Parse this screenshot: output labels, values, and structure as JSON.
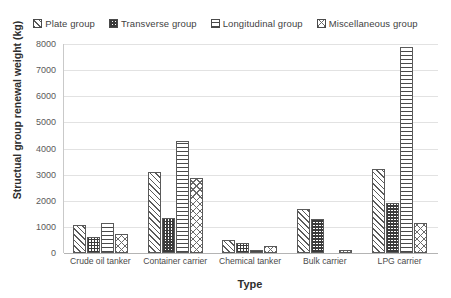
{
  "chart_data": {
    "type": "bar",
    "title": "",
    "xlabel": "Type",
    "ylabel": "Structual group renewal weight (kg)",
    "categories": [
      "Crude oil tanker",
      "Container carrier",
      "Chemical tanker",
      "Bulk carrier",
      "LPG carrier"
    ],
    "series": [
      {
        "name": "Plate group",
        "pattern": "diagonal-hatch",
        "values": [
          1080,
          3120,
          500,
          1700,
          3200
        ]
      },
      {
        "name": "Transverse group",
        "pattern": "checkerboard",
        "values": [
          620,
          1350,
          400,
          1300,
          1900
        ]
      },
      {
        "name": "Longitudinal group",
        "pattern": "horizontal-lines",
        "values": [
          1130,
          4300,
          100,
          0,
          7880
        ]
      },
      {
        "name": "Miscellaneous group",
        "pattern": "cross-dot",
        "values": [
          730,
          2880,
          250,
          100,
          1150
        ]
      }
    ],
    "ylim": [
      0,
      8000
    ],
    "yticks": [
      0,
      1000,
      2000,
      3000,
      4000,
      5000,
      6000,
      7000,
      8000
    ],
    "ytick_labels": [
      "0",
      "1000",
      "2000",
      "3000",
      "4000",
      "5000",
      "6000",
      "7000",
      "8000"
    ],
    "grid": true,
    "legend_position": "top"
  },
  "legend": {
    "items": [
      {
        "label": "Plate group"
      },
      {
        "label": "Transverse group"
      },
      {
        "label": "Longitudinal group"
      },
      {
        "label": "Miscellaneous group"
      }
    ]
  }
}
